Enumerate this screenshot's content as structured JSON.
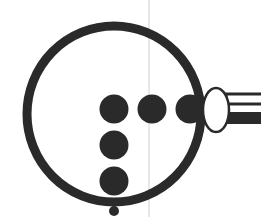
{
  "diagram": {
    "colors": {
      "background": "#ffffff",
      "ink": "#2a2a2a",
      "guide_line": "#cfcfcf"
    },
    "guide_line": {
      "x": 149,
      "y1": 0,
      "y2": 217
    },
    "lens_ring": {
      "cx": 114,
      "cy": 114,
      "rx": 87,
      "ry": 88,
      "stroke_width": 9
    },
    "dots": [
      {
        "id": "dot-row-1",
        "cx": 114,
        "cy": 109,
        "r": 14.5
      },
      {
        "id": "dot-row-2",
        "cx": 152,
        "cy": 109,
        "r": 14.5
      },
      {
        "id": "dot-row-3",
        "cx": 190,
        "cy": 109,
        "r": 14.5
      },
      {
        "id": "dot-col-1",
        "cx": 114,
        "cy": 145,
        "r": 14.5
      },
      {
        "id": "dot-col-2",
        "cx": 114,
        "cy": 181,
        "r": 14.5
      },
      {
        "id": "dot-small",
        "cx": 114,
        "cy": 211,
        "r": 5
      }
    ],
    "handle": {
      "ellipse": {
        "cx": 216,
        "cy": 110,
        "rx": 13,
        "ry": 22
      },
      "top_band": {
        "x": 226,
        "y": 94,
        "width": 40,
        "height": 10
      },
      "bottom_band": {
        "x": 226,
        "y": 112,
        "width": 40,
        "height": 12
      }
    }
  }
}
